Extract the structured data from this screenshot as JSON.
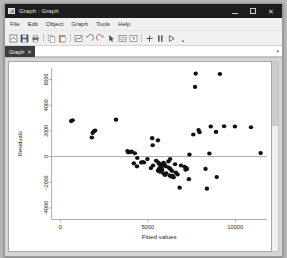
{
  "window": {
    "title": "Graph : Graph",
    "icon": "graph-window-icon",
    "controls": {
      "minimize": "minimize-button",
      "maximize": "maximize-button",
      "close_label": "✕"
    }
  },
  "menubar": {
    "items": [
      {
        "label": "File"
      },
      {
        "label": "Edit"
      },
      {
        "label": "Object"
      },
      {
        "label": "Graph"
      },
      {
        "label": "Tools"
      },
      {
        "label": "Help"
      }
    ]
  },
  "toolbar": {
    "items": [
      {
        "name": "new-graph-icon"
      },
      {
        "name": "save-icon"
      },
      {
        "name": "print-icon"
      },
      {
        "name": "copy-icon"
      },
      {
        "name": "paste-icon"
      },
      {
        "name": "graph-editor-icon"
      },
      {
        "name": "undo-icon"
      },
      {
        "name": "redo-icon"
      },
      {
        "name": "pointer-tool-icon"
      },
      {
        "name": "grid-edit-icon"
      },
      {
        "name": "text-tool-icon"
      },
      {
        "name": "add-line-icon"
      },
      {
        "name": "add-marker-icon"
      },
      {
        "name": "play-icon"
      }
    ]
  },
  "tabbar": {
    "tabs": [
      {
        "label": "Graph",
        "close": "✕",
        "active": true
      }
    ],
    "overflow_caret": "▾"
  },
  "chart_data": {
    "type": "scatter",
    "title": "",
    "xlabel": "Fitted values",
    "ylabel": "Residuals",
    "xlim": [
      -500,
      11800
    ],
    "ylim": [
      -4900,
      6900
    ],
    "xticks": [
      0,
      5000,
      10000
    ],
    "xticklabels": [
      "0",
      "5000",
      "10000"
    ],
    "yticks": [
      -4000,
      -2000,
      0,
      2000,
      4000,
      6000
    ],
    "yticklabels": [
      "-4000",
      "-2000",
      "0",
      "2000",
      "4000",
      "6000"
    ],
    "grid": false,
    "legend": null,
    "reference_lines": [
      {
        "axis": "y",
        "value": 0
      }
    ],
    "marker": {
      "shape": "circle",
      "color": "#111111",
      "size": 2.1
    },
    "points": [
      [
        620,
        2760
      ],
      [
        700,
        2830
      ],
      [
        1850,
        1840
      ],
      [
        1920,
        1960
      ],
      [
        1990,
        2020
      ],
      [
        1800,
        1480
      ],
      [
        3180,
        2870
      ],
      [
        3840,
        430
      ],
      [
        3880,
        330
      ],
      [
        4010,
        350
      ],
      [
        4080,
        380
      ],
      [
        4260,
        260
      ],
      [
        4400,
        -110
      ],
      [
        4200,
        -530
      ],
      [
        4380,
        -760
      ],
      [
        4620,
        -470
      ],
      [
        4700,
        -420
      ],
      [
        4780,
        -460
      ],
      [
        4980,
        -200
      ],
      [
        5250,
        1430
      ],
      [
        5280,
        880
      ],
      [
        5180,
        -900
      ],
      [
        5300,
        -700
      ],
      [
        5580,
        1260
      ],
      [
        5480,
        -330
      ],
      [
        5600,
        -460
      ],
      [
        5650,
        -560
      ],
      [
        5700,
        -620
      ],
      [
        5760,
        -700
      ],
      [
        5800,
        -760
      ],
      [
        5720,
        -860
      ],
      [
        5640,
        -960
      ],
      [
        5580,
        -1100
      ],
      [
        5700,
        -1180
      ],
      [
        5820,
        -1040
      ],
      [
        5900,
        -480
      ],
      [
        5960,
        -620
      ],
      [
        6020,
        -760
      ],
      [
        5900,
        -1320
      ],
      [
        5980,
        -1440
      ],
      [
        6060,
        -1300
      ],
      [
        6180,
        -380
      ],
      [
        6280,
        -190
      ],
      [
        6200,
        -860
      ],
      [
        6300,
        -980
      ],
      [
        6380,
        -1120
      ],
      [
        6250,
        -1480
      ],
      [
        6340,
        -1560
      ],
      [
        6420,
        -1500
      ],
      [
        6480,
        -1620
      ],
      [
        6600,
        -1250
      ],
      [
        6700,
        -1390
      ],
      [
        6820,
        -2420
      ],
      [
        6560,
        -600
      ],
      [
        6900,
        -700
      ],
      [
        7100,
        -800
      ],
      [
        7180,
        -880
      ],
      [
        7240,
        -960
      ],
      [
        7160,
        -1020
      ],
      [
        7350,
        -1760
      ],
      [
        7380,
        150
      ],
      [
        7600,
        1720
      ],
      [
        7740,
        6460
      ],
      [
        7700,
        5420
      ],
      [
        7900,
        2060
      ],
      [
        7960,
        1900
      ],
      [
        8300,
        -960
      ],
      [
        8380,
        -2500
      ],
      [
        8520,
        240
      ],
      [
        8600,
        2340
      ],
      [
        8900,
        1920
      ],
      [
        8940,
        -1600
      ],
      [
        9120,
        6430
      ],
      [
        9360,
        2360
      ],
      [
        9980,
        2340
      ],
      [
        10900,
        2280
      ],
      [
        11450,
        270
      ]
    ]
  }
}
